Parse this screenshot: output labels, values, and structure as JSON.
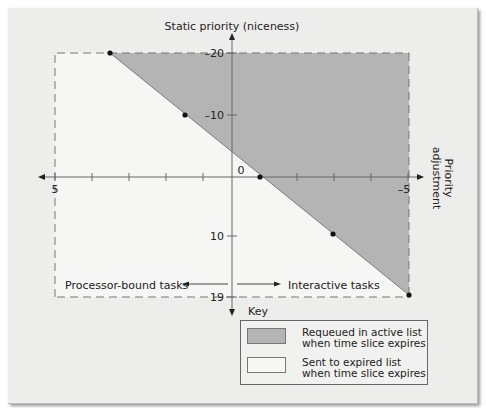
{
  "diagram": {
    "y_axis_title": "Static priority (niceness)",
    "x_axis_title": [
      "Priority",
      "adjustment"
    ],
    "y_ticks": [
      {
        "label": "–20",
        "y": 53
      },
      {
        "label": "–10",
        "y": 115
      },
      {
        "label": "0",
        "y": 170
      },
      {
        "label": "10",
        "y": 236
      },
      {
        "label": "19",
        "y": 297
      }
    ],
    "x_tick_labels": {
      "left": "5",
      "right": "–5"
    },
    "left_arrow_label": "Processor-bound tasks",
    "right_arrow_label": "Interactive tasks",
    "fill_color": "#b4b4b4",
    "points": [
      {
        "adj": 3.5,
        "prio": -20
      },
      {
        "adj": 1.5,
        "prio": -10
      },
      {
        "adj": -0.75,
        "prio": 0
      },
      {
        "adj": -2.75,
        "prio": 10
      },
      {
        "adj": -5,
        "prio": 19
      }
    ]
  },
  "key": {
    "title": "Key",
    "items": [
      {
        "line1": "Requeued in active list",
        "line2": "when time slice expires",
        "color": "#b4b4b4"
      },
      {
        "line1": "Sent to expired list",
        "line2": "when time slice expires",
        "color": "#f7f7f5"
      }
    ]
  }
}
